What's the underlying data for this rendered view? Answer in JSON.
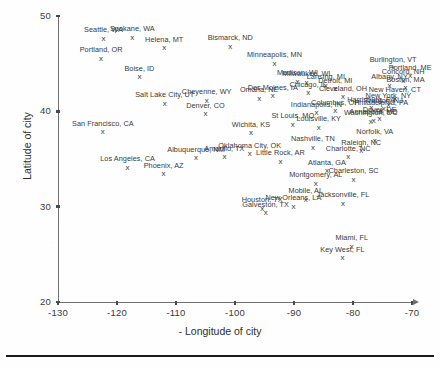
{
  "chart_data": {
    "type": "scatter",
    "title": "",
    "xlabel": "- Longitude of city",
    "ylabel": "Latitude of city",
    "xlim": [
      -130,
      -70
    ],
    "ylim": [
      20,
      50
    ],
    "xticks": [
      "-130",
      "-120",
      "-110",
      "-100",
      "-90",
      "-80",
      "-70"
    ],
    "yticks": [
      "20",
      "30",
      "40",
      "50"
    ],
    "grid": false,
    "legend": "none",
    "marker": "x",
    "point_label_field": "label",
    "points": [
      {
        "label": "Seattle, WA",
        "x": -122.3,
        "y": 47.6
      },
      {
        "label": "Spokane, WA",
        "x": -117.4,
        "y": 47.7
      },
      {
        "label": "Helena, MT",
        "x": -112.0,
        "y": 46.6
      },
      {
        "label": "Portland, OR",
        "x": -122.7,
        "y": 45.5
      },
      {
        "label": "Bismarck, ND",
        "x": -100.8,
        "y": 46.8
      },
      {
        "label": "Minneapolis, MN",
        "x": -93.3,
        "y": 45.0
      },
      {
        "label": "Boise, ID",
        "x": -116.2,
        "y": 43.6
      },
      {
        "label": "Burlington, VT",
        "x": -73.2,
        "y": 44.5
      },
      {
        "label": "Portland, ME",
        "x": -70.3,
        "y": 43.7
      },
      {
        "label": "Concord, NH",
        "x": -71.5,
        "y": 43.2
      },
      {
        "label": "Albany, NY",
        "x": -73.8,
        "y": 42.7
      },
      {
        "label": "Boston, MA",
        "x": -71.1,
        "y": 42.4
      },
      {
        "label": "New Haven, CT",
        "x": -72.9,
        "y": 41.3
      },
      {
        "label": "Madison, WI",
        "x": -89.4,
        "y": 43.1
      },
      {
        "label": "Milwaukee, WI",
        "x": -87.9,
        "y": 43.0
      },
      {
        "label": "Lansing, MI",
        "x": -84.6,
        "y": 42.7
      },
      {
        "label": "Detroit, MI",
        "x": -83.0,
        "y": 42.3
      },
      {
        "label": "Chicago, IL",
        "x": -87.6,
        "y": 41.9
      },
      {
        "label": "Cleveland, OH",
        "x": -81.7,
        "y": 41.5
      },
      {
        "label": "Omaha, NE",
        "x": -95.9,
        "y": 41.3
      },
      {
        "label": "Des Moines, IA",
        "x": -93.6,
        "y": 41.6
      },
      {
        "label": "Salt Lake City, UT",
        "x": -111.9,
        "y": 40.8
      },
      {
        "label": "Cheyenne, WY",
        "x": -104.8,
        "y": 41.1
      },
      {
        "label": "Denver, CO",
        "x": -105.0,
        "y": 39.7
      },
      {
        "label": "San Francisco, CA",
        "x": -122.4,
        "y": 37.8
      },
      {
        "label": "Indianapolis, IN",
        "x": -86.2,
        "y": 39.8
      },
      {
        "label": "St Louis, MO",
        "x": -90.2,
        "y": 38.6
      },
      {
        "label": "Louisville, KY",
        "x": -85.8,
        "y": 38.3
      },
      {
        "label": "Columbus, OH",
        "x": -83.0,
        "y": 40.0
      },
      {
        "label": "Harrisburg, PA",
        "x": -76.9,
        "y": 40.3
      },
      {
        "label": "Philadelphia, PA",
        "x": -75.2,
        "y": 40.0
      },
      {
        "label": "New York, NY",
        "x": -74.0,
        "y": 40.7
      },
      {
        "label": "Trenton, NJ",
        "x": -74.8,
        "y": 40.2
      },
      {
        "label": "Washington, DC",
        "x": -77.0,
        "y": 38.9
      },
      {
        "label": "Dover, DE",
        "x": -75.5,
        "y": 39.2
      },
      {
        "label": "Annapolis, MD",
        "x": -76.5,
        "y": 39.0
      },
      {
        "label": "Wichita, KS",
        "x": -97.3,
        "y": 37.7
      },
      {
        "label": "Norfolk, VA",
        "x": -76.3,
        "y": 36.9
      },
      {
        "label": "Raleigh, NC",
        "x": -78.6,
        "y": 35.8
      },
      {
        "label": "Charlotte, NC",
        "x": -80.8,
        "y": 35.2
      },
      {
        "label": "Los Angeles, CA",
        "x": -118.2,
        "y": 34.1
      },
      {
        "label": "Phoenix, AZ",
        "x": -112.1,
        "y": 33.4
      },
      {
        "label": "Albuquerque, NM",
        "x": -106.6,
        "y": 35.1
      },
      {
        "label": "Amarillo, TX",
        "x": -101.8,
        "y": 35.2
      },
      {
        "label": "Oklahoma City, OK",
        "x": -97.5,
        "y": 35.5
      },
      {
        "label": "Little Rock, AR",
        "x": -92.3,
        "y": 34.7
      },
      {
        "label": "Nashville, TN",
        "x": -86.8,
        "y": 36.2
      },
      {
        "label": "Atlanta, GA",
        "x": -84.4,
        "y": 33.7
      },
      {
        "label": "Charleston, SC",
        "x": -79.9,
        "y": 32.8
      },
      {
        "label": "Montgomery, AL",
        "x": -86.3,
        "y": 32.4
      },
      {
        "label": "Mobile, AL",
        "x": -88.0,
        "y": 30.7
      },
      {
        "label": "New Orleans, LA",
        "x": -90.1,
        "y": 30.0
      },
      {
        "label": "Jacksonville, FL",
        "x": -81.7,
        "y": 30.3
      },
      {
        "label": "Houston, TX",
        "x": -95.4,
        "y": 29.8
      },
      {
        "label": "Galveston, TX",
        "x": -94.8,
        "y": 29.3
      },
      {
        "label": "Miami, FL",
        "x": -80.2,
        "y": 25.8
      },
      {
        "label": "Key West, FL",
        "x": -81.8,
        "y": 24.6
      }
    ]
  },
  "colors": {
    "axis": "#6f6f6f",
    "text": "#3a3a3a",
    "marker": "#3d3d3d",
    "background": "#fefefe",
    "rule": "#1a1a1a"
  }
}
